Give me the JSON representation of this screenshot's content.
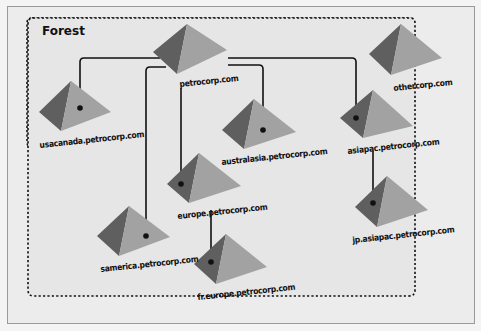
{
  "diagram": {
    "type": "active-directory-forest",
    "container": {
      "title": "Forest",
      "style": "dashed-rounded-rectangle"
    },
    "colors": {
      "background": "#ececec",
      "pyramid_dark": "#5f5f5f",
      "pyramid_light": "#a2a2a2",
      "connector": "#111111",
      "border": "#9a9a9a"
    },
    "domains": [
      {
        "id": "petrocorp",
        "label": "petrocorp.com",
        "parent": null
      },
      {
        "id": "usacanada",
        "label": "usacanada.petrocorp.com",
        "parent": "petrocorp"
      },
      {
        "id": "australasia",
        "label": "australasia.petrocorp.com",
        "parent": "petrocorp"
      },
      {
        "id": "asiapac",
        "label": "asiapac.petrocorp.com",
        "parent": "petrocorp"
      },
      {
        "id": "europe",
        "label": "europe.petrocorp.com",
        "parent": "petrocorp"
      },
      {
        "id": "samerica",
        "label": "samerica.petrocorp.com",
        "parent": "petrocorp"
      },
      {
        "id": "fr_europe",
        "label": "fr.europe.petrocorp.com",
        "parent": "europe"
      },
      {
        "id": "jp_asiapac",
        "label": "jp.asiapac.petrocorp.com",
        "parent": "asiapac"
      },
      {
        "id": "othercorp",
        "label": "othercorp.com",
        "parent": null
      }
    ]
  }
}
